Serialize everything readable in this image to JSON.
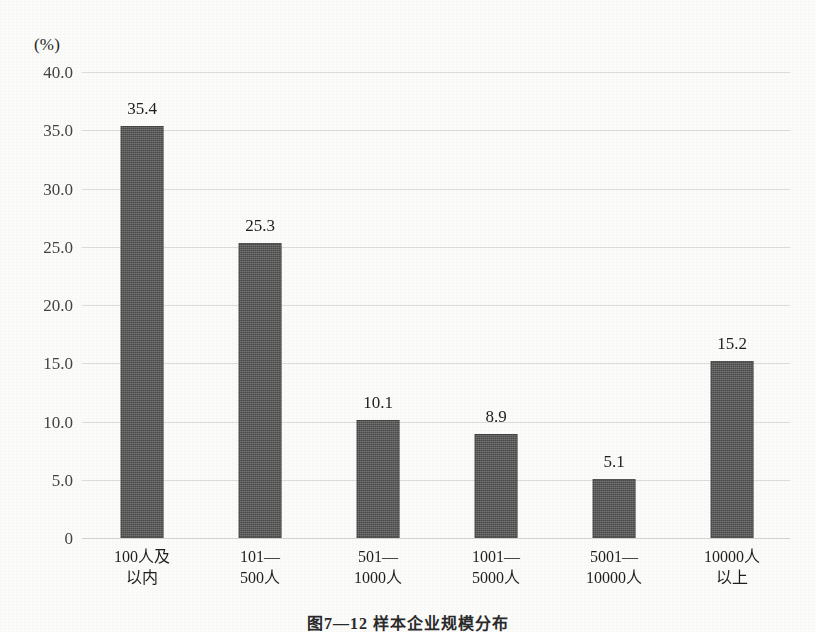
{
  "figure": {
    "unit_label": "(%)",
    "caption": "图7—12  样本企业规模分布"
  },
  "chart_data": {
    "type": "bar",
    "title": "图7—12  样本企业规模分布",
    "xlabel": "",
    "ylabel": "(%)",
    "ylim": [
      0,
      40
    ],
    "grid": true,
    "legend": "none",
    "categories": [
      "100人及以内",
      "101—500人",
      "501—1000人",
      "1001—5000人",
      "5001—10000人",
      "10000人以上"
    ],
    "category_lines": [
      [
        "100人及",
        "以内"
      ],
      [
        "101—",
        "500人"
      ],
      [
        "501—",
        "1000人"
      ],
      [
        "1001—",
        "5000人"
      ],
      [
        "5001—",
        "10000人"
      ],
      [
        "10000人",
        "以上"
      ]
    ],
    "values": [
      35.4,
      25.3,
      10.1,
      8.9,
      5.1,
      15.2
    ],
    "value_labels": [
      "35.4",
      "25.3",
      "10.1",
      "8.9",
      "5.1",
      "15.2"
    ],
    "yticks": [
      40,
      35,
      30,
      25,
      20,
      15,
      10,
      5,
      0
    ],
    "ytick_labels": [
      "40.0",
      "35.0",
      "30.0",
      "25.0",
      "20.0",
      "15.0",
      "10.0",
      "5.0",
      "0"
    ],
    "bar_color": "#585858",
    "gridline_color": "#d8d6d2",
    "background_color": "#fbfbfa"
  }
}
